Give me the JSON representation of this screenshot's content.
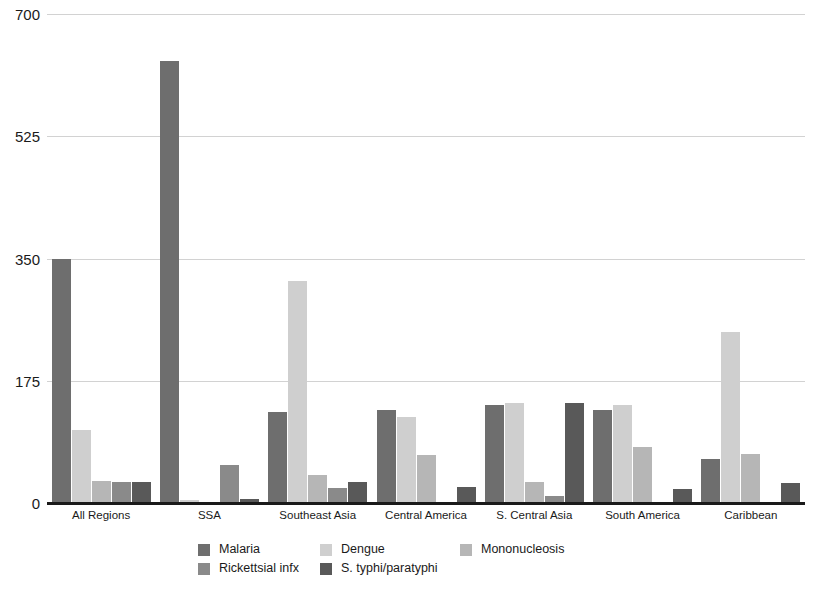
{
  "chart_data": {
    "type": "bar",
    "title": "",
    "subtitle": "",
    "xlabel": "",
    "ylabel": "",
    "ylim": [
      0,
      700
    ],
    "yticks": [
      0,
      175,
      350,
      525,
      700
    ],
    "grid": true,
    "legend_position": "bottom",
    "categories": [
      "All Regions",
      "SSA",
      "Southeast Asia",
      "Central America",
      "S. Central Asia",
      "South America",
      "Caribbean"
    ],
    "series": [
      {
        "name": "Malaria",
        "color": "#6e6e6e",
        "values": [
          350,
          633,
          130,
          133,
          140,
          133,
          63
        ]
      },
      {
        "name": "Dengue",
        "color": "#cfcfcf",
        "values": [
          105,
          5,
          318,
          123,
          143,
          140,
          245
        ]
      },
      {
        "name": "Mononucleosis",
        "color": "#b6b6b6",
        "values": [
          31,
          2,
          40,
          69,
          30,
          80,
          70
        ]
      },
      {
        "name": "Rickettsial infx",
        "color": "#8a8a8a",
        "values": [
          30,
          55,
          22,
          0,
          10,
          0,
          0
        ]
      },
      {
        "name": "S. typhi/paratyphi",
        "color": "#595959",
        "values": [
          30,
          6,
          30,
          23,
          143,
          20,
          28
        ]
      }
    ]
  },
  "axis": {
    "y_tick_labels": [
      "700",
      "525",
      "350",
      "175",
      "0"
    ],
    "x_tick_labels": [
      "All Regions",
      "SSA",
      "Southeast Asia",
      "Central America",
      "S. Central Asia",
      "South America",
      "Caribbean"
    ]
  },
  "legend": {
    "rows": [
      [
        {
          "label": "Malaria",
          "color": "#6e6e6e"
        },
        {
          "label": "Dengue",
          "color": "#cfcfcf"
        },
        {
          "label": "Mononucleosis",
          "color": "#b6b6b6"
        }
      ],
      [
        {
          "label": "Rickettsial infx",
          "color": "#8a8a8a"
        },
        {
          "label": "S. typhi/paratyphi",
          "color": "#595959"
        }
      ]
    ]
  },
  "colors": {
    "gridline": "#d2d2d2",
    "axis": "#1a1a1a",
    "background": "#ffffff"
  }
}
